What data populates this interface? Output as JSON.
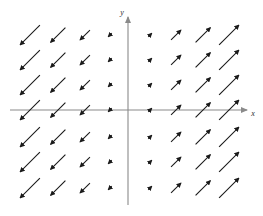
{
  "figure": {
    "title": "",
    "background_color": "#ffffff"
  },
  "chart_data": {
    "type": "scatter",
    "subtype": "direction-field",
    "title": "",
    "xlabel": "x",
    "ylabel": "y",
    "grid": false,
    "legend": false,
    "xlim": [
      -4.5,
      4.5
    ],
    "ylim": [
      -4.0,
      3.5
    ],
    "arrow_color": "#1a1a1a",
    "axis_color": "#8a8a8a",
    "x": [
      -4,
      -3,
      -2,
      -1,
      1,
      2,
      3,
      4
    ],
    "y": [
      3,
      2,
      1,
      0,
      -1,
      -2,
      -3
    ],
    "vector_rule": "u = k*x, v = k*x",
    "columns": [
      {
        "x": -4,
        "u": -1,
        "v": -1,
        "magnitude": 28,
        "direction_deg": 225
      },
      {
        "x": -3,
        "u": -1,
        "v": -1,
        "magnitude": 21,
        "direction_deg": 225
      },
      {
        "x": -2,
        "u": -1,
        "v": -1,
        "magnitude": 14,
        "direction_deg": 225
      },
      {
        "x": -1,
        "u": -1,
        "v": -1,
        "magnitude": 5,
        "direction_deg": 225
      },
      {
        "x": 1,
        "u": 1,
        "v": 1,
        "magnitude": 5,
        "direction_deg": 45
      },
      {
        "x": 2,
        "u": 1,
        "v": 1,
        "magnitude": 14,
        "direction_deg": 45
      },
      {
        "x": 3,
        "u": 1,
        "v": 1,
        "magnitude": 21,
        "direction_deg": 45
      },
      {
        "x": 4,
        "u": 1,
        "v": 1,
        "magnitude": 28,
        "direction_deg": 45
      }
    ],
    "column_pixel_centers": [
      30,
      58,
      85,
      110,
      150,
      176,
      203,
      229
    ],
    "row_pixel_centers": [
      35,
      60,
      85,
      110,
      137,
      162,
      188
    ],
    "axes_pixels": {
      "x_axis_y": 110,
      "x_axis_start": 10,
      "x_axis_end": 247,
      "y_axis_x": 128,
      "y_axis_top": 17,
      "y_axis_bottom": 205
    }
  },
  "labels": {
    "x_axis": "x",
    "y_axis": "y"
  }
}
